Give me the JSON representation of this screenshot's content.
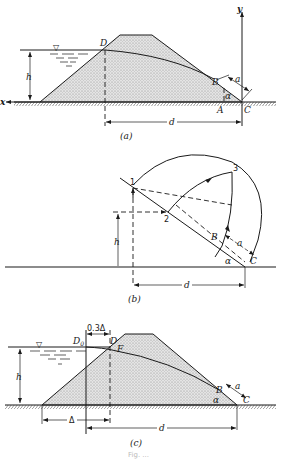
{
  "figure": {
    "panels": [
      {
        "id": "a",
        "caption": "(a)",
        "labels": {
          "D": "D",
          "B": "B",
          "A": "A",
          "C": "C",
          "x": "x",
          "y": "y",
          "h": "h",
          "d": "d",
          "a": "a",
          "alpha": "α"
        }
      },
      {
        "id": "b",
        "caption": "(b)",
        "labels": {
          "p1": "1",
          "p2": "2",
          "p3": "3",
          "B": "B",
          "C": "C",
          "h": "h",
          "d": "d",
          "a": "a",
          "alpha": "α"
        }
      },
      {
        "id": "c",
        "caption": "(c)",
        "labels": {
          "D0": "D",
          "D0_sub": "0",
          "D": "D",
          "F": "F",
          "B": "B",
          "C": "C",
          "h": "h",
          "d": "d",
          "a": "a",
          "alpha": "α",
          "delta": "Δ",
          "offset": "0.3Δ"
        }
      }
    ],
    "water_symbol": "▽",
    "caption_text": "Fig. ..."
  },
  "colors": {
    "ink": "#1a1a1a",
    "fill": "#d9d9d9",
    "background": "#ffffff"
  }
}
